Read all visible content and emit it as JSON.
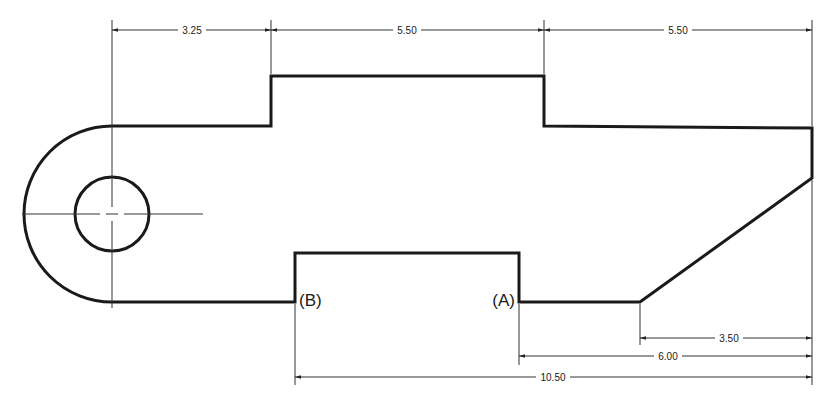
{
  "drawing": {
    "type": "engineering-drawing",
    "outline_color": "#1a1a1a",
    "background": "#ffffff",
    "dimensions": {
      "top": [
        {
          "id": "dim-top-1",
          "value": "3.25"
        },
        {
          "id": "dim-top-2",
          "value": "5.50"
        },
        {
          "id": "dim-top-3",
          "value": "5.50"
        }
      ],
      "bottom": [
        {
          "id": "dim-bottom-1",
          "value": "3.50"
        },
        {
          "id": "dim-bottom-2",
          "value": "6.00"
        },
        {
          "id": "dim-bottom-3",
          "value": "10.50"
        }
      ]
    },
    "labels": {
      "a": "(A)",
      "b": "(B)"
    },
    "features": {
      "hole": "circular-hole",
      "end": "rounded-end",
      "chamfer": "angled-edge"
    }
  }
}
